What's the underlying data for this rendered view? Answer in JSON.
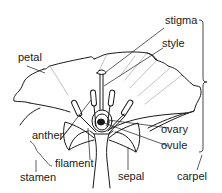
{
  "diagram": {
    "labels": {
      "petal": "petal",
      "stigma": "stigma",
      "style": "style",
      "anther": "anther",
      "ovary": "ovary",
      "ovule": "ovule",
      "filament": "filament",
      "stamen": "stamen",
      "sepal": "sepal",
      "carpel": "carpel"
    },
    "colors": {
      "line": "#1a1a1a",
      "leader": "#1a1a1a",
      "background": "#ffffff"
    }
  }
}
